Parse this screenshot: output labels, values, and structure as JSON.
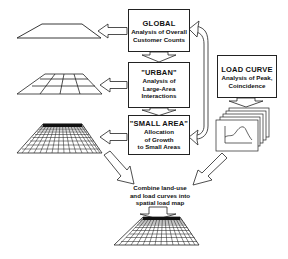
{
  "boxes": {
    "global": {
      "title": "GLOBAL",
      "lines": [
        "Analysis of Overall",
        "Customer Counts"
      ]
    },
    "urban": {
      "title": "\"URBAN\"",
      "lines": [
        "Analysis of",
        "Large-Area",
        "Interactions"
      ]
    },
    "small_area": {
      "title": "\"SMALL AREA\"",
      "lines": [
        "Allocation",
        "of Growth",
        "to Small Areas"
      ]
    },
    "load_curve": {
      "title": "LOAD CURVE",
      "lines": [
        "Analysis of Peak,",
        "Coincidence"
      ]
    }
  },
  "caption": {
    "lines": [
      "Combine land-use",
      "and load curves into",
      "spatial load map"
    ]
  },
  "icons": {
    "global_map": "flat-trapezoid-icon",
    "urban_map": "coarse-grid-map-icon",
    "small_area_map": "fine-grid-map-icon",
    "load_curve_sheets": "stacked-load-curve-charts-icon",
    "final_map": "fine-grid-map-icon"
  },
  "colors": {
    "line": "#222222",
    "background": "#ffffff"
  }
}
